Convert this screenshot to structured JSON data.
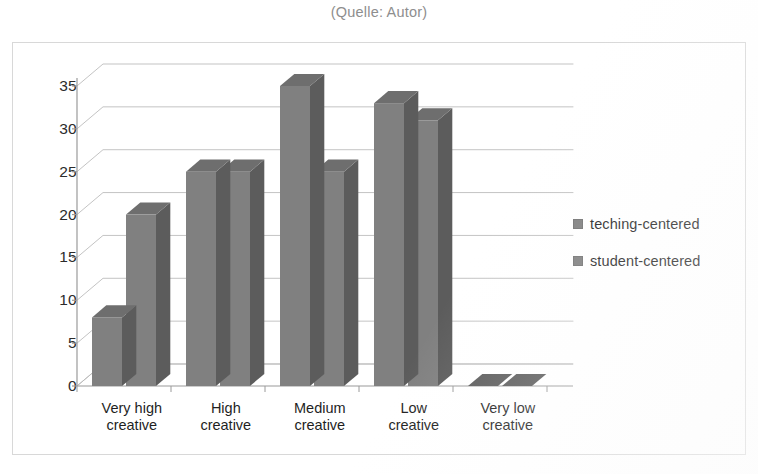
{
  "caption": "(Quelle: Autor)",
  "legend": {
    "position": "right",
    "items": [
      {
        "label": "teching-centered",
        "color": "#7e7e7e"
      },
      {
        "label": "student-centered",
        "color": "#7e7e7e"
      }
    ]
  },
  "colors": {
    "bar_front": "#808080",
    "bar_side": "#5c5c5c",
    "bar_top": "#6e6e6e",
    "gridline": "#b9b9b9",
    "axis": "#9a9a9a",
    "frame": "#d8d8d8",
    "caption_text": "#8e8e8e",
    "tick_text": "#2b2b2b"
  },
  "chart_data": {
    "type": "bar",
    "title": "",
    "subtitle": "",
    "xlabel": "",
    "ylabel": "",
    "categories": [
      "Very high\ncreative",
      "High\ncreative",
      "Medium\ncreative",
      "Low\ncreative",
      "Very low\ncreative"
    ],
    "series": [
      {
        "name": "teching-centered",
        "values": [
          8,
          25,
          35,
          33,
          0
        ]
      },
      {
        "name": "student-centered",
        "values": [
          20,
          25,
          25,
          31,
          0
        ]
      }
    ],
    "ylim": [
      0,
      35
    ],
    "yticks": [
      0,
      5,
      10,
      15,
      20,
      25,
      30,
      35
    ],
    "ytick_labels": [
      "0",
      "5",
      "10",
      "15",
      "20",
      "25",
      "30",
      "35"
    ],
    "grid": true,
    "legend_position": "right",
    "style": "3d"
  }
}
